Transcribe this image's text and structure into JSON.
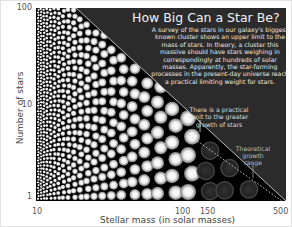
{
  "chart_data": {
    "type": "scatter",
    "title": "How Big Can a Star Be?",
    "description": "A survey of the stars in our galaxy's biggest known cluster shows an upper limit to the mass of stars. In theory, a cluster this massive should have stars weighing in correspondingly at hundreds of solar masses. Apparently, the star-forming processes in the present-day universe reach a practical limiting weight for stars.",
    "xlabel": "Stellar mass (in solar masses)",
    "ylabel": "Number of stars",
    "x_scale": "log",
    "y_scale": "log",
    "xlim": [
      10,
      500
    ],
    "ylim": [
      1,
      100
    ],
    "x_ticks": [
      "10",
      "100",
      "150",
      "500"
    ],
    "y_ticks": [
      "100",
      "10",
      "1"
    ],
    "annotations": [
      {
        "text": "There is a practical limit to the greater growth of stars",
        "x": 150
      },
      {
        "text": "Theoretical growth range",
        "x_range": [
          150,
          500
        ]
      }
    ],
    "regions": [
      {
        "name": "observed stars",
        "x_range": [
          10,
          150
        ]
      },
      {
        "name": "theoretical growth range (no stars)",
        "x_range": [
          150,
          500
        ]
      }
    ]
  },
  "colors": {
    "plot_bg": "#000000",
    "title_box": "#2b2b2b",
    "star": "#ffffff",
    "axis_text": "#555555"
  }
}
